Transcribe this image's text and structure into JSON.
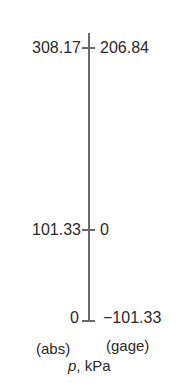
{
  "diagram": {
    "axis": {
      "unit_symbol": "p",
      "unit_text": ", kPa",
      "left_caption": "(abs)",
      "right_caption": "(gage)"
    },
    "ticks": [
      {
        "abs": "308.17",
        "gage": "206.84"
      },
      {
        "abs": "101.33",
        "gage": "0"
      },
      {
        "abs": "0",
        "gage": "−101.33"
      }
    ],
    "colors": {
      "axis": "#6a6a6a",
      "text": "#2a2a2a",
      "background": "#ffffff"
    }
  }
}
